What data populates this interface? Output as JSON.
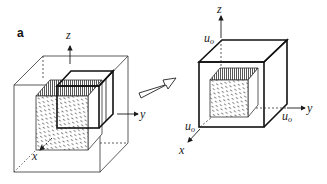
{
  "figure": {
    "panel_label": "a",
    "left_diagram": {
      "axis_labels": {
        "x": "x",
        "y": "y",
        "z": "z"
      }
    },
    "transition_arrow": "hollow-arrow-right",
    "right_diagram": {
      "axis_labels": {
        "x": "x",
        "y": "y",
        "z": "z"
      },
      "displacement_labels": {
        "top": {
          "base": "u",
          "sub": "o"
        },
        "right": {
          "base": "u",
          "sub": "o"
        },
        "left": {
          "base": "u",
          "sub": "o"
        }
      }
    },
    "colors": {
      "line": "#1a1a1a",
      "thin_line": "#333333",
      "hatch": "#555555",
      "background": "#ffffff"
    }
  }
}
